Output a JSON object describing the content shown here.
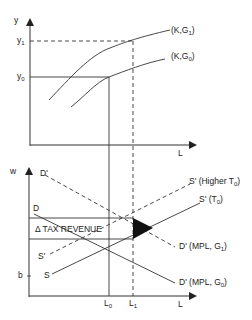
{
  "top_panel": {
    "y_axis_label": "y",
    "x_axis_label": "L",
    "y_ticks": {
      "y1": {
        "main": "y",
        "sub": "1"
      },
      "y0": {
        "main": "y",
        "sub": "0"
      }
    },
    "curves": [
      {
        "name": "production-function-G1",
        "label_pre": "(K,G",
        "label_sub": "1",
        "label_post": ")"
      },
      {
        "name": "production-function-G0",
        "label_pre": "(K,G",
        "label_sub": "0",
        "label_post": ")"
      }
    ]
  },
  "bottom_panel": {
    "y_axis_label": "w",
    "x_axis_label": "L",
    "b_label": "b",
    "x_ticks": {
      "L0": {
        "main": "L",
        "sub": "0"
      },
      "L1": {
        "main": "L",
        "sub": "1"
      }
    },
    "area_label": "Δ TAX REVENUE",
    "curves": {
      "D_prime_top": "D'",
      "D_top": "D",
      "S_prime_left": "S'",
      "S_left": "S",
      "S_prime_higher": {
        "pre": "S' (Higher T",
        "sub": "0",
        "post": ")"
      },
      "S_prime_T0": {
        "pre": "S' (T",
        "sub": "0",
        "post": ")"
      },
      "D_prime_G1": {
        "pre": "D' (MPL, G",
        "sub": "1",
        "post": ")"
      },
      "D_prime_G0": {
        "pre": "D' (MPL, G",
        "sub": "0",
        "post": ")"
      }
    }
  },
  "colors": {
    "line": "#333333",
    "fill": "#111111",
    "background": "#ffffff"
  }
}
